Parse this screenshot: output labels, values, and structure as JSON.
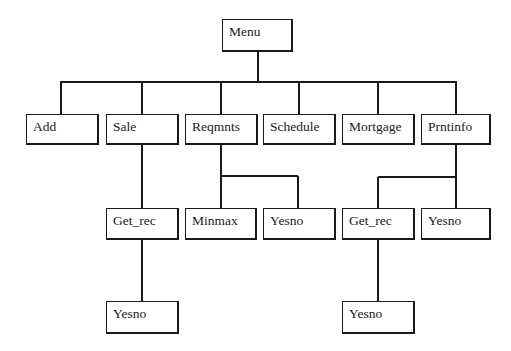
{
  "diagram": {
    "type": "hierarchy-chart",
    "line_color": "#1a1a1a",
    "nodes": {
      "menu": {
        "label": "Menu"
      },
      "add": {
        "label": "Add"
      },
      "sale": {
        "label": "Sale"
      },
      "reqmnts": {
        "label": "Reqmnts"
      },
      "schedule": {
        "label": "Schedule"
      },
      "mortgage": {
        "label": "Mortgage"
      },
      "prntinfo": {
        "label": "Prntinfo"
      },
      "sale_get_rec": {
        "label": "Get_rec"
      },
      "reqmnts_minmax": {
        "label": "Minmax"
      },
      "reqmnts_yesno": {
        "label": "Yesno"
      },
      "prntinfo_get_rec": {
        "label": "Get_rec"
      },
      "prntinfo_yesno": {
        "label": "Yesno"
      },
      "sale_get_rec_yesno": {
        "label": "Yesno"
      },
      "prntinfo_get_rec_yesno": {
        "label": "Yesno"
      }
    },
    "edges": [
      [
        "Menu",
        "Add"
      ],
      [
        "Menu",
        "Sale"
      ],
      [
        "Menu",
        "Reqmnts"
      ],
      [
        "Menu",
        "Schedule"
      ],
      [
        "Menu",
        "Mortgage"
      ],
      [
        "Menu",
        "Prntinfo"
      ],
      [
        "Sale",
        "Get_rec"
      ],
      [
        "Get_rec",
        "Yesno"
      ],
      [
        "Reqmnts",
        "Minmax"
      ],
      [
        "Reqmnts",
        "Yesno"
      ],
      [
        "Prntinfo",
        "Get_rec"
      ],
      [
        "Prntinfo",
        "Yesno"
      ],
      [
        "Get_rec",
        "Yesno"
      ]
    ]
  }
}
